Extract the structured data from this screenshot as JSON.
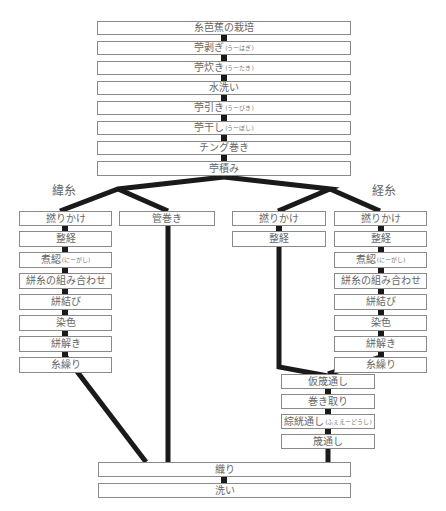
{
  "common_steps": [
    {
      "label": "糸芭蕉の栽培",
      "ruby": ""
    },
    {
      "label": "苧剥ぎ",
      "ruby": "(うーはぎ)"
    },
    {
      "label": "苧炊き",
      "ruby": "(うーたき)"
    },
    {
      "label": "水洗い",
      "ruby": ""
    },
    {
      "label": "苧引き",
      "ruby": "(うーびき)"
    },
    {
      "label": "苧干し",
      "ruby": "(うーぼし)"
    },
    {
      "label": "チング巻き",
      "ruby": ""
    },
    {
      "label": "苧積み",
      "ruby": ""
    }
  ],
  "weft": {
    "label": "緯糸",
    "branch_a": [
      {
        "label": "撚りかけ",
        "ruby": ""
      },
      {
        "label": "整経",
        "ruby": ""
      },
      {
        "label": "煮綛",
        "ruby": "(にーがし)"
      },
      {
        "label": "絣糸の組み合わせ",
        "ruby": ""
      },
      {
        "label": "絣結び",
        "ruby": ""
      },
      {
        "label": "染色",
        "ruby": ""
      },
      {
        "label": "絣解き",
        "ruby": ""
      },
      {
        "label": "糸繰り",
        "ruby": ""
      }
    ],
    "branch_b": [
      {
        "label": "管巻き",
        "ruby": ""
      }
    ]
  },
  "warp": {
    "label": "経糸",
    "branch_a": [
      {
        "label": "撚りかけ",
        "ruby": ""
      },
      {
        "label": "整経",
        "ruby": ""
      }
    ],
    "branch_b": [
      {
        "label": "撚りかけ",
        "ruby": ""
      },
      {
        "label": "整経",
        "ruby": ""
      },
      {
        "label": "煮綛",
        "ruby": "(にーがし)"
      },
      {
        "label": "絣糸の組み合わせ",
        "ruby": ""
      },
      {
        "label": "絣結び",
        "ruby": ""
      },
      {
        "label": "染色",
        "ruby": ""
      },
      {
        "label": "絣解き",
        "ruby": ""
      },
      {
        "label": "糸繰り",
        "ruby": ""
      }
    ],
    "merged": [
      {
        "label": "仮筬通し",
        "ruby": ""
      },
      {
        "label": "巻き取り",
        "ruby": ""
      },
      {
        "label": "綜絖通し",
        "ruby": "(ふぇえーどうし)"
      },
      {
        "label": "筬通し",
        "ruby": ""
      }
    ]
  },
  "final_steps": [
    {
      "label": "織り",
      "ruby": ""
    },
    {
      "label": "洗い",
      "ruby": ""
    }
  ],
  "colors": {
    "line": "#1a1a1a",
    "box_border": "#8a8a8a",
    "text": "#666666"
  }
}
